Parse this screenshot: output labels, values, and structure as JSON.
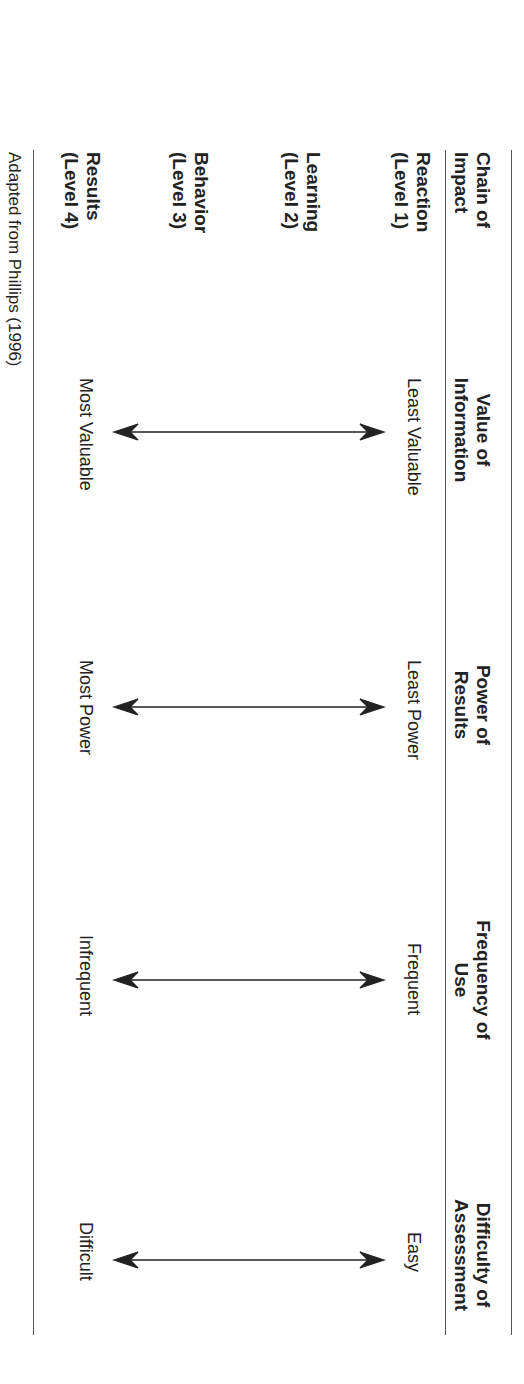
{
  "table": {
    "headers": [
      "Chain of Impact",
      "Value of Information",
      "Power of Results",
      "Frequency of Use",
      "Difficulty of Assessment"
    ],
    "levels": [
      "Reaction (Level 1)",
      "Learning (Level 2)",
      "Behavior (Level 3)",
      "Results (Level 4)"
    ],
    "columns": [
      {
        "top": "Least Valuable",
        "bottom": "Most Valuable"
      },
      {
        "top": "Least Power",
        "bottom": "Most Power"
      },
      {
        "top": "Frequent",
        "bottom": "Infrequent"
      },
      {
        "top": "Easy",
        "bottom": "Difficult"
      }
    ]
  },
  "source_note": "Adapted from Phillips (1996)"
}
